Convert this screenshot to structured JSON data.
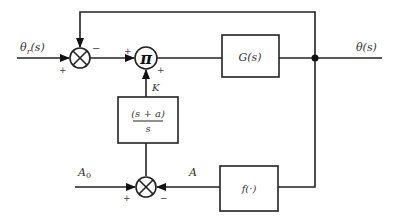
{
  "diagram": {
    "input_label": "θr(s)",
    "input_symbol": "θ",
    "input_subscript": "r",
    "input_arg": "(s)",
    "output_label": "θ(s)",
    "plant_block": "G(s)",
    "multiplier_symbol": "π",
    "gain_label": "K",
    "compensator_numerator": "(s + a)",
    "compensator_denominator": "s",
    "nonlinear_block": "f(·)",
    "reference_amplitude": "A0",
    "reference_symbol": "A",
    "reference_subscript": "0",
    "feedback_amplitude": "A",
    "signs": {
      "summer1_input": "+",
      "summer1_feedback": "−",
      "multiplier_left": "+",
      "multiplier_bottom": "+",
      "summer2_left": "+",
      "summer2_right": "−"
    }
  }
}
